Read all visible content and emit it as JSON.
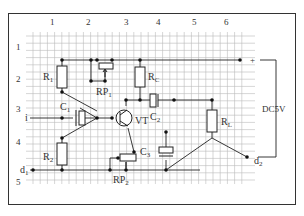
{
  "diagram": {
    "type": "circuit-breadboard-layout",
    "column_labels": [
      "1",
      "2",
      "3",
      "4",
      "5",
      "6"
    ],
    "row_labels": [
      "1",
      "2",
      "3",
      "4",
      "5"
    ],
    "power": {
      "plus": "+",
      "minus": "−",
      "supply_label": "DC5V"
    },
    "terminals": {
      "input": "i",
      "d1": "d",
      "d1_sub": "1",
      "d2": "d",
      "d2_sub": "2"
    },
    "components": {
      "R1": {
        "main": "R",
        "sub": "1"
      },
      "R2": {
        "main": "R",
        "sub": "2"
      },
      "RC": {
        "main": "R",
        "sub": "C"
      },
      "RL": {
        "main": "R",
        "sub": "L"
      },
      "RP1": {
        "main": "RP",
        "sub": "1"
      },
      "RP2": {
        "main": "RP",
        "sub": "2"
      },
      "C1": {
        "main": "C",
        "sub": "1"
      },
      "C2": {
        "main": "C",
        "sub": "2"
      },
      "C3": {
        "main": "C",
        "sub": "3"
      },
      "VT": {
        "main": "VT",
        "sub": ""
      }
    }
  }
}
